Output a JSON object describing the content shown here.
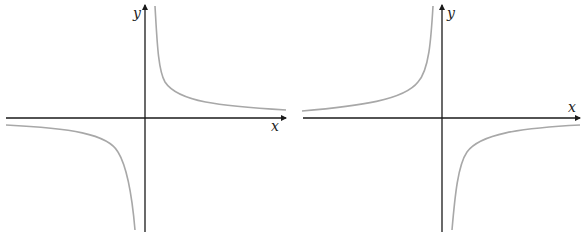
{
  "graphs": [
    {
      "name": "hyperbola-positive-k",
      "x_label": "x",
      "y_label": "y",
      "branches": [
        "quadrant-I",
        "quadrant-III"
      ]
    },
    {
      "name": "hyperbola-negative-k",
      "x_label": "x",
      "y_label": "y",
      "branches": [
        "quadrant-II",
        "quadrant-IV"
      ]
    }
  ],
  "colors": {
    "axis": "#1a1a1a",
    "curve": "#a8a8a8",
    "background": "#ffffff"
  }
}
